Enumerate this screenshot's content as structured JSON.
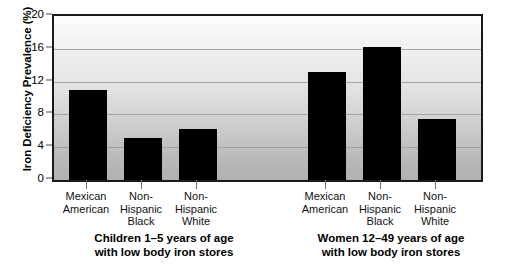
{
  "chart_data": {
    "type": "bar",
    "title": "",
    "xlabel": "",
    "ylabel": "Iron Deficiency Prevalence (%)",
    "ylim": [
      0,
      20
    ],
    "yticks": [
      0,
      4,
      8,
      12,
      16,
      20
    ],
    "grid": true,
    "legend": "none",
    "bar_color": "#000000",
    "categories": [
      "Mexican American",
      "Non-Hispanic Black",
      "Non-Hispanic White",
      "Mexican American",
      "Non-Hispanic Black",
      "Non-Hispanic White"
    ],
    "values": [
      11.0,
      5.1,
      6.2,
      13.2,
      16.2,
      7.4
    ],
    "groups": [
      {
        "caption_line1": "Children 1–5 years of age",
        "caption_line2": "with low body iron stores",
        "categories": [
          {
            "line1": "Mexican",
            "line2": "American",
            "line3": ""
          },
          {
            "line1": "Non-",
            "line2": "Hispanic",
            "line3": "Black"
          },
          {
            "line1": "Non-",
            "line2": "Hispanic",
            "line3": "White"
          }
        ],
        "values": [
          11.0,
          5.1,
          6.2
        ]
      },
      {
        "caption_line1": "Women 12–49 years of age",
        "caption_line2": "with low body iron stores",
        "categories": [
          {
            "line1": "Mexican",
            "line2": "American",
            "line3": ""
          },
          {
            "line1": "Non-",
            "line2": "Hispanic",
            "line3": "Black"
          },
          {
            "line1": "Non-",
            "line2": "Hispanic",
            "line3": "White"
          }
        ],
        "values": [
          13.2,
          16.2,
          7.4
        ]
      }
    ]
  },
  "axis": {
    "y_title": "Iron Deficiency Prevalence (%)",
    "ytick_labels": [
      "20",
      "16",
      "12",
      "8",
      "4",
      "0"
    ]
  }
}
